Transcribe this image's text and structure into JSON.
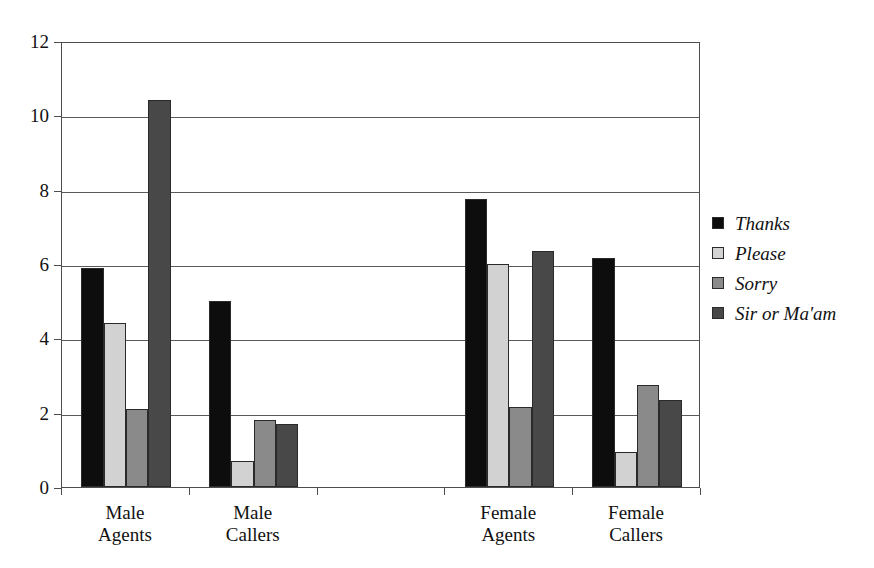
{
  "chart_data": {
    "type": "bar",
    "title": "",
    "subtitle": "",
    "xlabel": "",
    "ylabel": "",
    "ylim": [
      0,
      12
    ],
    "ytick_step": 2,
    "yticks": [
      "0",
      "2",
      "4",
      "6",
      "8",
      "10",
      "12"
    ],
    "grid": true,
    "grid_axis": "y",
    "legend_position": "right",
    "categories": [
      "Male\nAgents",
      "Male\nCallers",
      "",
      "Female\nAgents",
      "Female\nCallers"
    ],
    "category_labels_flat": [
      "Male Agents",
      "Male Callers",
      "",
      "Female Agents",
      "Female Callers"
    ],
    "series": [
      {
        "name": "Thanks",
        "color": "#0d0d0d",
        "values": [
          5.9,
          5.0,
          null,
          7.75,
          6.15
        ]
      },
      {
        "name": "Please",
        "color": "#d2d2d2",
        "values": [
          4.4,
          0.7,
          null,
          6.0,
          0.95
        ]
      },
      {
        "name": "Sorry",
        "color": "#8a8a8a",
        "values": [
          2.1,
          1.8,
          null,
          2.15,
          2.75
        ]
      },
      {
        "name": "Sir or Ma'am",
        "color": "#484848",
        "values": [
          10.4,
          1.7,
          null,
          6.35,
          2.35
        ]
      }
    ]
  },
  "legend": {
    "items": [
      {
        "label": "Thanks",
        "color": "#0d0d0d"
      },
      {
        "label": "Please",
        "color": "#d2d2d2"
      },
      {
        "label": "Sorry",
        "color": "#8a8a8a"
      },
      {
        "label": "Sir or Ma'am",
        "color": "#484848"
      }
    ]
  },
  "colors": {
    "axis": "#4d4d4d",
    "grid": "#5a5a5a",
    "background": "#ffffff",
    "text": "#111111"
  }
}
